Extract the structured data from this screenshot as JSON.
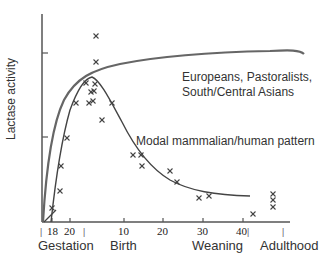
{
  "chart_data": {
    "type": "line",
    "title": "",
    "ylabel": "Lactase activity",
    "xlabel": "",
    "grid": false,
    "x_tick_labels": [
      "|",
      "18",
      "20",
      "|",
      "10",
      "20",
      "30",
      "40|",
      "|"
    ],
    "period_labels": [
      "Gestation",
      "Birth",
      "Weaning",
      "Adulthood"
    ],
    "series": [
      {
        "name": "Europeans, Pastoralists, South/Central Asians",
        "description": "rises steeply during late gestation, peaks near birth and remains high into adulthood",
        "points": [
          [
            43,
            222
          ],
          [
            50,
            160
          ],
          [
            62,
            110
          ],
          [
            80,
            82
          ],
          [
            100,
            70
          ],
          [
            140,
            60
          ],
          [
            200,
            55
          ],
          [
            260,
            52
          ],
          [
            300,
            50
          ],
          [
            304,
            54
          ]
        ]
      },
      {
        "name": "Modal mammalian/human pattern",
        "description": "rises during gestation, peaks around birth then declines after weaning",
        "points": [
          [
            52,
            222
          ],
          [
            58,
            180
          ],
          [
            66,
            130
          ],
          [
            78,
            95
          ],
          [
            90,
            78
          ],
          [
            98,
            82
          ],
          [
            110,
            100
          ],
          [
            125,
            125
          ],
          [
            140,
            148
          ],
          [
            160,
            170
          ],
          [
            180,
            185
          ],
          [
            200,
            192
          ],
          [
            220,
            195
          ],
          [
            250,
            196
          ]
        ]
      }
    ],
    "scatter_points": [
      [
        52,
        208
      ],
      [
        60,
        191
      ],
      [
        61,
        166
      ],
      [
        67,
        138
      ],
      [
        76,
        103
      ],
      [
        86,
        83
      ],
      [
        89,
        103
      ],
      [
        91,
        92
      ],
      [
        93,
        101
      ],
      [
        94,
        91
      ],
      [
        95,
        84
      ],
      [
        96,
        62
      ],
      [
        96,
        36
      ],
      [
        102,
        120
      ],
      [
        112,
        103
      ],
      [
        133,
        155
      ],
      [
        141,
        155
      ],
      [
        142,
        166
      ],
      [
        170,
        171
      ],
      [
        177,
        182
      ],
      [
        199,
        198
      ],
      [
        209,
        196
      ],
      [
        253,
        214
      ],
      [
        273,
        194
      ],
      [
        273,
        200
      ],
      [
        273,
        207
      ]
    ],
    "annotations": [
      {
        "text": "Europeans, Pastoralists,",
        "x": 182,
        "y": 68
      },
      {
        "text": "South/Central Asians",
        "x": 182,
        "y": 83
      },
      {
        "text": "Modal mammalian/human pattern",
        "x": 136,
        "y": 138
      }
    ]
  },
  "labels": {
    "ylabel": "Lactase activity",
    "ticks": [
      "|",
      "18",
      "20",
      "|",
      "10",
      "20",
      "30",
      "40|",
      "|"
    ],
    "periods": [
      "Gestation",
      "Birth",
      "Weaning",
      "Adulthood"
    ],
    "anno_high_1": "Europeans, Pastoralists,",
    "anno_high_2": "South/Central Asians",
    "anno_modal": "Modal mammalian/human pattern"
  }
}
